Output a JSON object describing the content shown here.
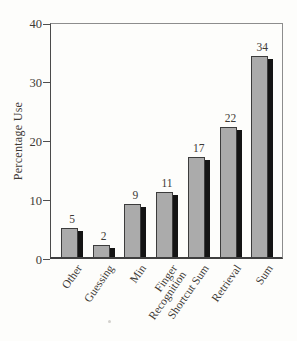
{
  "chart_data": {
    "type": "bar",
    "title": "",
    "xlabel": "",
    "ylabel": "Percentage Use",
    "categories": [
      "Other",
      "Guessing",
      "Min",
      "Finger\nRecognition",
      "Shortcut Sum",
      "Retrieval",
      "Sum"
    ],
    "values": [
      5,
      2,
      9,
      11,
      17,
      22,
      34
    ],
    "data_labels": [
      "5",
      "2",
      "9",
      "11",
      "17",
      "22",
      "34"
    ],
    "ylim": [
      0,
      40
    ],
    "yticks": [
      0,
      10,
      20,
      30,
      40
    ],
    "grid": false,
    "legend": null,
    "plot_box": true,
    "bar_color": "#ababab",
    "bar_border_color": "#3c3c3c",
    "bar_shadow_color": "#141414",
    "axis_color": "#4a4a4a",
    "text_color": "#3d3a36",
    "background_color": "#fdfdfb"
  }
}
